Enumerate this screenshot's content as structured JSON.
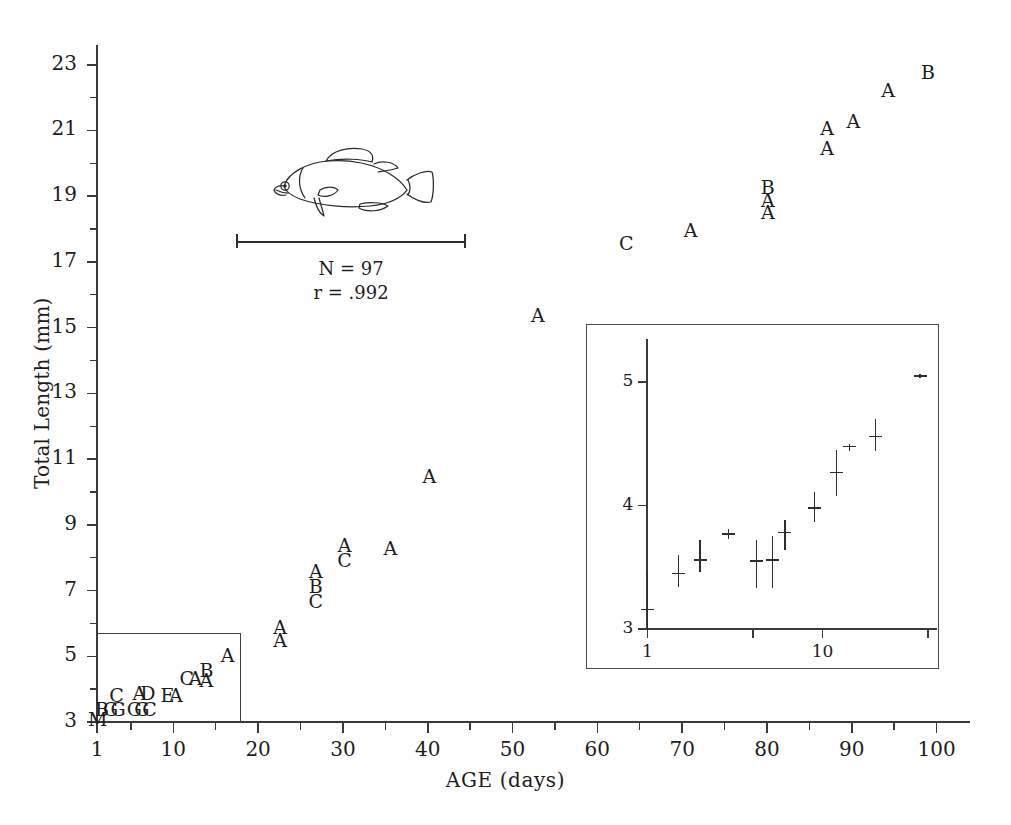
{
  "figure": {
    "xlabel": "AGE (days)",
    "ylabel": "Total Length (mm)",
    "annotations": {
      "n": "N = 97",
      "r": "r = .992"
    },
    "icon": "fish-illustration"
  },
  "chart_data": {
    "type": "scatter",
    "title": "",
    "xlabel": "AGE (days)",
    "ylabel": "Total Length (mm)",
    "xlim": [
      1,
      103
    ],
    "ylim": [
      3,
      23.6
    ],
    "grid": false,
    "legend": null,
    "notes": [
      "N = 97",
      "r = .992"
    ],
    "point_labels_meaning": "letter codes denote number of overlapping observations (A=1, B=2, C=3, ... M=13)",
    "xticks": [
      1,
      10,
      20,
      30,
      40,
      50,
      60,
      70,
      80,
      90,
      100
    ],
    "xtick_labels": [
      "1",
      "10",
      "20",
      "30",
      "40",
      "50",
      "60",
      "70",
      "80",
      "90",
      "100"
    ],
    "x_minor_ticks": [
      5,
      15,
      25,
      35,
      45,
      55,
      65,
      75,
      85,
      95
    ],
    "yticks": [
      3,
      5,
      7,
      9,
      11,
      13,
      15,
      17,
      19,
      21,
      23
    ],
    "ytick_labels": [
      "3",
      "5",
      "7",
      "9",
      "11",
      "13",
      "15",
      "17",
      "19",
      "21",
      "23"
    ],
    "y_minor_ticks": [
      4,
      6,
      8,
      10,
      12,
      14,
      16,
      18,
      20,
      22
    ],
    "points": [
      {
        "label": "M",
        "x": 1,
        "y": 3.05
      },
      {
        "label": "B",
        "x": 1.6,
        "y": 3.35
      },
      {
        "label": "G",
        "x": 2.6,
        "y": 3.35
      },
      {
        "label": "G",
        "x": 3.5,
        "y": 3.35
      },
      {
        "label": "C",
        "x": 3.3,
        "y": 3.8
      },
      {
        "label": "G",
        "x": 5.4,
        "y": 3.35
      },
      {
        "label": "G",
        "x": 6.3,
        "y": 3.35
      },
      {
        "label": "C",
        "x": 7.2,
        "y": 3.35
      },
      {
        "label": "A",
        "x": 6.0,
        "y": 3.85
      },
      {
        "label": "D",
        "x": 7.0,
        "y": 3.85
      },
      {
        "label": "E",
        "x": 9.3,
        "y": 3.8
      },
      {
        "label": "A",
        "x": 10.3,
        "y": 3.8
      },
      {
        "label": "C",
        "x": 11.6,
        "y": 4.3
      },
      {
        "label": "A",
        "x": 12.6,
        "y": 4.3
      },
      {
        "label": "B",
        "x": 13.9,
        "y": 4.55
      },
      {
        "label": "A",
        "x": 13.9,
        "y": 4.25
      },
      {
        "label": "A",
        "x": 16.4,
        "y": 5.0
      },
      {
        "label": "A",
        "x": 22.6,
        "y": 5.85
      },
      {
        "label": "A",
        "x": 22.6,
        "y": 5.45
      },
      {
        "label": "A",
        "x": 26.8,
        "y": 7.55
      },
      {
        "label": "B",
        "x": 26.8,
        "y": 7.1
      },
      {
        "label": "C",
        "x": 26.8,
        "y": 6.65
      },
      {
        "label": "A",
        "x": 30.2,
        "y": 8.35
      },
      {
        "label": "C",
        "x": 30.2,
        "y": 7.9
      },
      {
        "label": "A",
        "x": 35.6,
        "y": 8.25
      },
      {
        "label": "A",
        "x": 40.2,
        "y": 10.45
      },
      {
        "label": "A",
        "x": 53.0,
        "y": 15.35
      },
      {
        "label": "C",
        "x": 63.4,
        "y": 17.55
      },
      {
        "label": "A",
        "x": 71.0,
        "y": 17.95
      },
      {
        "label": "B",
        "x": 80.1,
        "y": 19.25
      },
      {
        "label": "A",
        "x": 80.1,
        "y": 18.85
      },
      {
        "label": "A",
        "x": 80.1,
        "y": 18.5
      },
      {
        "label": "A",
        "x": 87.1,
        "y": 21.05
      },
      {
        "label": "A",
        "x": 87.1,
        "y": 20.45
      },
      {
        "label": "A",
        "x": 90.2,
        "y": 21.25
      },
      {
        "label": "A",
        "x": 94.3,
        "y": 22.2
      },
      {
        "label": "B",
        "x": 99.0,
        "y": 22.75
      }
    ],
    "highlight_box": {
      "x_range": [
        1,
        18
      ],
      "y_range": [
        3,
        5.7
      ]
    },
    "inset": {
      "type": "scatter",
      "xscale": "log",
      "xlim": [
        0.85,
        45
      ],
      "ylim": [
        3,
        5.35
      ],
      "xticks": [
        1,
        4,
        10,
        40
      ],
      "xtick_labels": [
        "1",
        "",
        "10",
        ""
      ],
      "yticks": [
        3,
        4,
        5
      ],
      "ytick_labels": [
        "3",
        "4",
        "5"
      ],
      "xlabel": "",
      "ylabel": "",
      "grid": false,
      "points": [
        {
          "x": 1.0,
          "y": 3.16,
          "lo": 2.98,
          "hi": 3.45
        },
        {
          "x": 1.5,
          "y": 3.45,
          "lo": 3.34,
          "hi": 3.6
        },
        {
          "x": 2.0,
          "y": 3.56,
          "lo": 3.46,
          "hi": 3.72
        },
        {
          "x": 2.9,
          "y": 3.77,
          "lo": 3.77,
          "hi": 3.77
        },
        {
          "x": 4.2,
          "y": 3.55,
          "lo": 3.33,
          "hi": 3.72
        },
        {
          "x": 5.2,
          "y": 3.56,
          "lo": 3.33,
          "hi": 3.75
        },
        {
          "x": 6.1,
          "y": 3.78,
          "lo": 3.64,
          "hi": 3.88
        },
        {
          "x": 9.0,
          "y": 3.98,
          "lo": 3.87,
          "hi": 4.11
        },
        {
          "x": 12.0,
          "y": 4.27,
          "lo": 4.08,
          "hi": 4.45
        },
        {
          "x": 14.2,
          "y": 4.48,
          "lo": 4.44,
          "hi": 4.5
        },
        {
          "x": 20.0,
          "y": 4.56,
          "lo": 4.44,
          "hi": 4.7
        },
        {
          "x": 36.0,
          "y": 5.05,
          "lo": 5.03,
          "hi": 5.07
        }
      ]
    }
  }
}
